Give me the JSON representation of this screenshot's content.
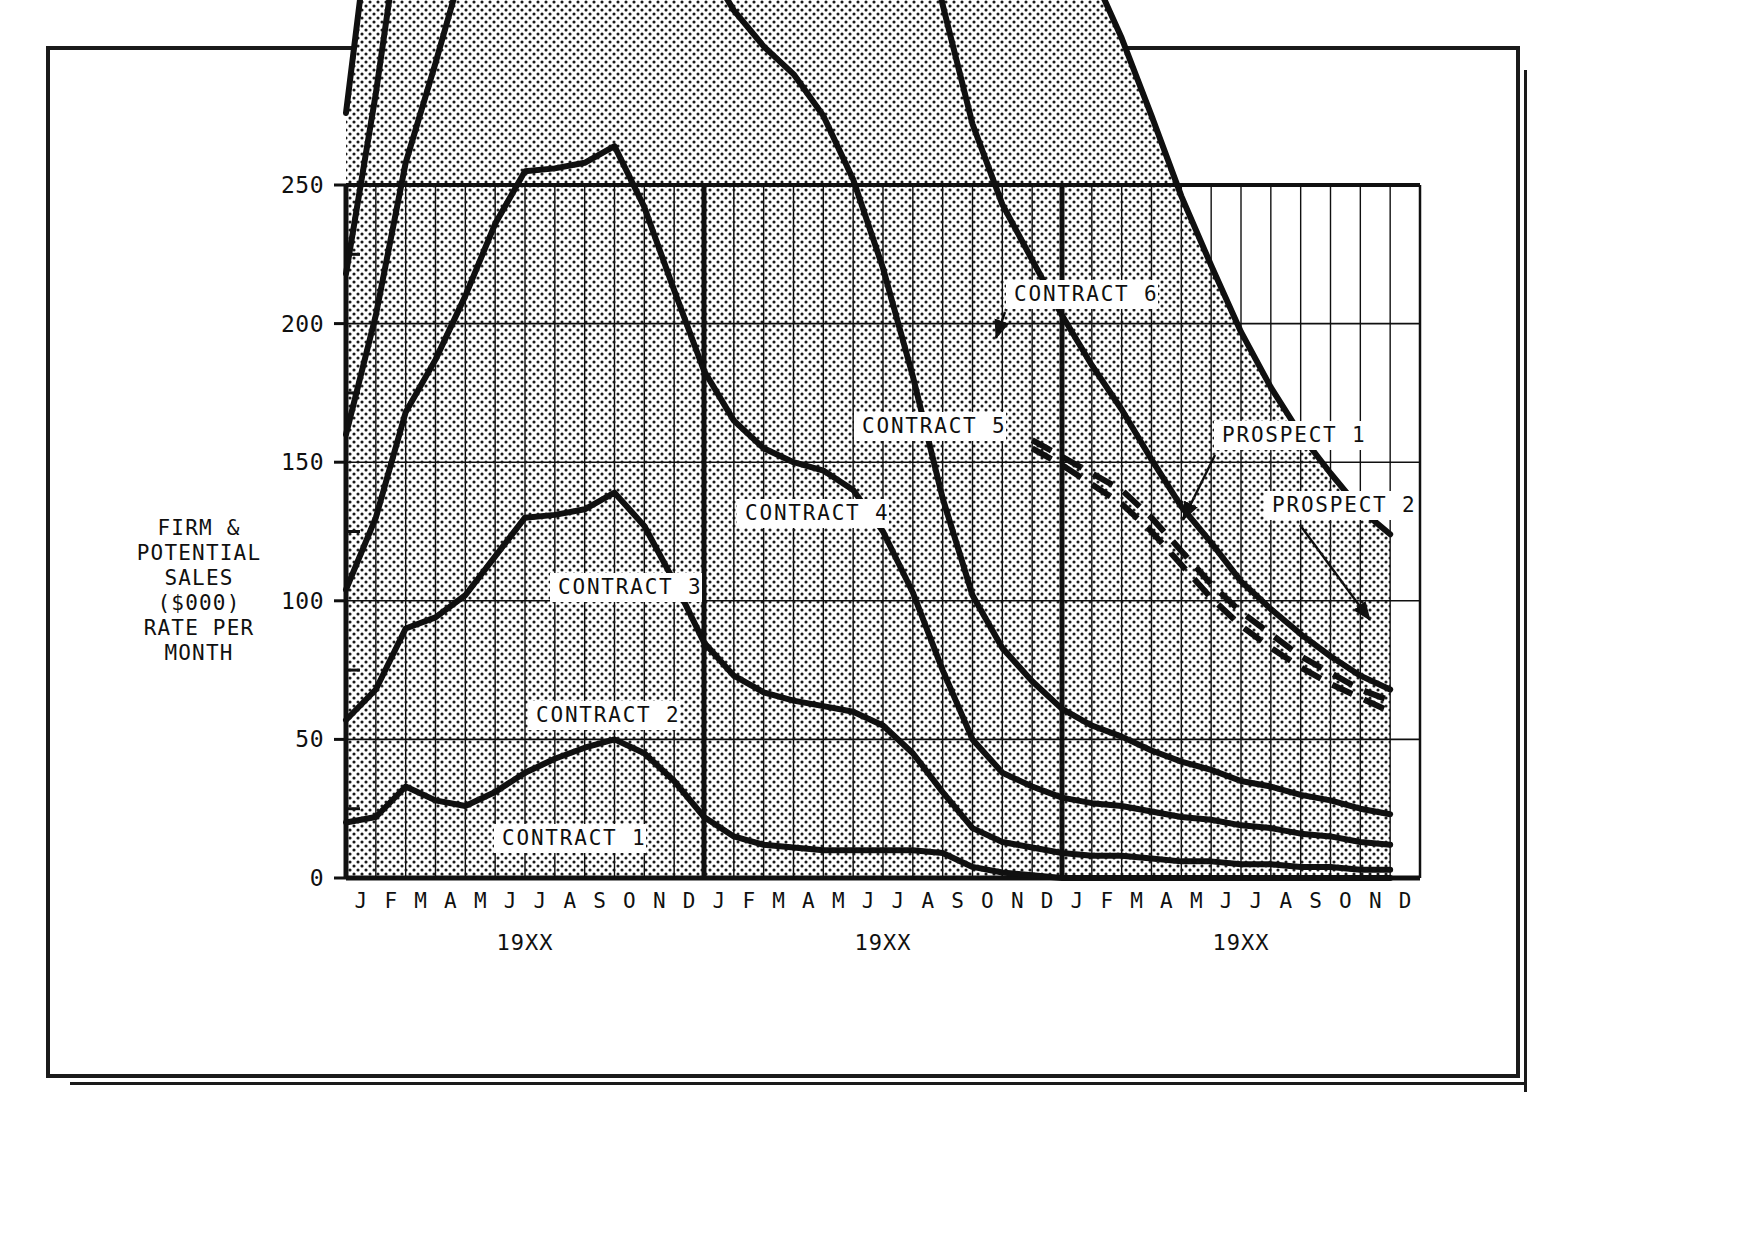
{
  "figure": {
    "y_axis_caption": "FIRM &\nPOTENTIAL\nSALES\n($000)\nRATE PER\nMONTH"
  },
  "chart_data": {
    "type": "area",
    "title": "",
    "subtitle": "",
    "xlabel": "",
    "ylabel": "FIRM & POTENTIAL SALES ($000) RATE PER MONTH",
    "ylim": [
      0,
      250
    ],
    "ytick_labels": [
      "0",
      "50",
      "100",
      "150",
      "200",
      "250"
    ],
    "ytick_values": [
      0,
      50,
      100,
      150,
      200,
      250
    ],
    "yminor_values": [
      25,
      75,
      125,
      175,
      225
    ],
    "grid": true,
    "legend_position": "inline-annotations",
    "stacked": true,
    "x_tick_labels": [
      "J",
      "F",
      "M",
      "A",
      "M",
      "J",
      "J",
      "A",
      "S",
      "O",
      "N",
      "D",
      "J",
      "F",
      "M",
      "A",
      "M",
      "J",
      "J",
      "A",
      "S",
      "O",
      "N",
      "D",
      "J",
      "F",
      "M",
      "A",
      "M",
      "J",
      "J",
      "A",
      "S",
      "O",
      "N",
      "D"
    ],
    "x_group_labels": [
      "19XX",
      "19XX",
      "19XX"
    ],
    "x_group_sizes": [
      12,
      12,
      12
    ],
    "series": [
      {
        "name": "CONTRACT 1",
        "style": "solid",
        "cumulative": true,
        "values": [
          20,
          22,
          33,
          28,
          26,
          31,
          38,
          43,
          47,
          50,
          45,
          35,
          22,
          15,
          12,
          11,
          10,
          10,
          10,
          10,
          9,
          4,
          2,
          1,
          0,
          0,
          0,
          0,
          0,
          0,
          0,
          0,
          0,
          0,
          0,
          0
        ]
      },
      {
        "name": "CONTRACT 2",
        "style": "solid",
        "cumulative": true,
        "values": [
          37,
          46,
          57,
          66,
          76,
          85,
          92,
          88,
          86,
          89,
          82,
          72,
          63,
          58,
          55,
          53,
          52,
          50,
          45,
          35,
          22,
          14,
          11,
          10,
          9,
          8,
          8,
          7,
          6,
          6,
          5,
          5,
          4,
          4,
          3,
          3
        ]
      },
      {
        "name": "CONTRACT 3",
        "style": "solid",
        "cumulative": true,
        "values": [
          47,
          62,
          78,
          93,
          108,
          120,
          125,
          125,
          125,
          125,
          115,
          105,
          98,
          92,
          88,
          86,
          85,
          80,
          70,
          58,
          44,
          32,
          25,
          22,
          20,
          19,
          18,
          17,
          16,
          15,
          14,
          13,
          12,
          11,
          10,
          9
        ]
      },
      {
        "name": "CONTRACT 4",
        "style": "solid",
        "cumulative": true,
        "values": [
          56,
          73,
          90,
          107,
          122,
          136,
          147,
          155,
          163,
          165,
          157,
          150,
          148,
          148,
          145,
          140,
          128,
          112,
          95,
          78,
          62,
          52,
          45,
          38,
          32,
          28,
          25,
          22,
          20,
          18,
          16,
          15,
          14,
          13,
          12,
          11
        ]
      },
      {
        "name": "CONTRACT 5",
        "style": "solid",
        "cumulative": true,
        "values": [
          58,
          80,
          100,
          120,
          140,
          158,
          172,
          180,
          182,
          182,
          182,
          182,
          184,
          186,
          190,
          193,
          191,
          188,
          186,
          184,
          178,
          170,
          160,
          152,
          142,
          130,
          118,
          105,
          92,
          82,
          72,
          64,
          58,
          52,
          48,
          45
        ]
      },
      {
        "name": "CONTRACT 6",
        "style": "solid",
        "cumulative": true,
        "values": [
          58,
          80,
          100,
          120,
          140,
          158,
          172,
          182,
          188,
          192,
          196,
          199,
          200,
          200,
          200,
          200,
          200,
          200,
          200,
          198,
          190,
          180,
          170,
          158,
          150,
          142,
          134,
          124,
          112,
          100,
          90,
          80,
          72,
          66,
          60,
          56
        ]
      },
      {
        "name": "PROSPECT 1",
        "style": "dashed",
        "cumulative": true,
        "values": [
          null,
          null,
          null,
          null,
          null,
          null,
          null,
          null,
          null,
          null,
          null,
          null,
          null,
          null,
          null,
          null,
          null,
          null,
          null,
          null,
          null,
          null,
          null,
          158,
          152,
          146,
          140,
          130,
          118,
          106,
          96,
          88,
          80,
          74,
          68,
          64
        ]
      },
      {
        "name": "PROSPECT 2",
        "style": "dashed",
        "cumulative": true,
        "values": [
          null,
          null,
          null,
          null,
          null,
          null,
          null,
          null,
          null,
          null,
          null,
          null,
          null,
          null,
          null,
          null,
          null,
          null,
          null,
          null,
          null,
          null,
          null,
          155,
          149,
          142,
          135,
          125,
          113,
          101,
          91,
          83,
          76,
          70,
          65,
          60
        ]
      }
    ],
    "annotations": [
      {
        "text": "CONTRACT 1",
        "leader": false
      },
      {
        "text": "CONTRACT 2",
        "leader": false
      },
      {
        "text": "CONTRACT 3",
        "leader": false
      },
      {
        "text": "CONTRACT 4",
        "leader": false
      },
      {
        "text": "CONTRACT 5",
        "leader": false
      },
      {
        "text": "CONTRACT 6",
        "leader": true
      },
      {
        "text": "PROSPECT 1",
        "leader": true
      },
      {
        "text": "PROSPECT 2",
        "leader": true
      }
    ]
  }
}
